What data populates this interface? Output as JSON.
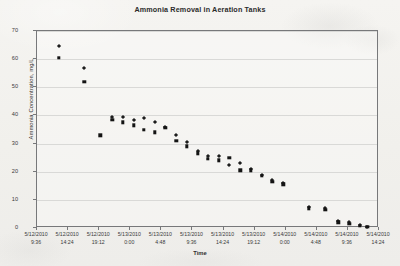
{
  "chart_data": {
    "type": "scatter",
    "title": "Ammonia Removal in Aeration Tanks",
    "xlabel": "Time",
    "ylabel": "Ammonia Concentration, mg/L",
    "grid": true,
    "legend": "none",
    "ylim": [
      0,
      70
    ],
    "yticks": [
      0,
      10,
      20,
      30,
      40,
      50,
      60,
      70
    ],
    "xtick_labels": [
      {
        "date": "5/12/2010",
        "time": "9:36"
      },
      {
        "date": "5/12/2010",
        "time": "14:24"
      },
      {
        "date": "5/12/2010",
        "time": "19:12"
      },
      {
        "date": "5/13/2010",
        "time": "0:00"
      },
      {
        "date": "5/13/2010",
        "time": "4:48"
      },
      {
        "date": "5/13/2010",
        "time": "9:36"
      },
      {
        "date": "5/13/2010",
        "time": "14:24"
      },
      {
        "date": "5/13/2010",
        "time": "19:12"
      },
      {
        "date": "5/14/2010",
        "time": "0:00"
      },
      {
        "date": "5/14/2010",
        "time": "4:48"
      },
      {
        "date": "5/14/2010",
        "time": "9:36"
      },
      {
        "date": "5/14/2010",
        "time": "14:24"
      }
    ],
    "xlim_hours": [
      0,
      52.8
    ],
    "series": [
      {
        "name": "Aeration Tank 1",
        "marker": "diamond",
        "points": [
          {
            "x": 3.4,
            "y": 64.5
          },
          {
            "x": 7.3,
            "y": 57.0
          },
          {
            "x": 11.6,
            "y": 39.5
          },
          {
            "x": 13.2,
            "y": 39.5
          },
          {
            "x": 14.9,
            "y": 38.5
          },
          {
            "x": 16.5,
            "y": 39.0
          },
          {
            "x": 18.2,
            "y": 37.5
          },
          {
            "x": 19.8,
            "y": 36.0
          },
          {
            "x": 21.5,
            "y": 33.0
          },
          {
            "x": 23.1,
            "y": 30.5
          },
          {
            "x": 24.8,
            "y": 27.5
          },
          {
            "x": 26.4,
            "y": 25.5
          },
          {
            "x": 28.1,
            "y": 25.5
          },
          {
            "x": 29.7,
            "y": 22.5
          },
          {
            "x": 31.4,
            "y": 23.0
          },
          {
            "x": 33.0,
            "y": 21.0
          },
          {
            "x": 34.7,
            "y": 19.0
          },
          {
            "x": 36.3,
            "y": 17.0
          },
          {
            "x": 38.0,
            "y": 16.0
          },
          {
            "x": 42.0,
            "y": 7.5
          },
          {
            "x": 44.5,
            "y": 7.0
          },
          {
            "x": 46.5,
            "y": 2.5
          },
          {
            "x": 48.2,
            "y": 2.0
          },
          {
            "x": 49.8,
            "y": 1.0
          },
          {
            "x": 51.0,
            "y": 0.5
          }
        ]
      },
      {
        "name": "Aeration Tank 2",
        "marker": "square",
        "points": [
          {
            "x": 3.4,
            "y": 60.5
          },
          {
            "x": 7.3,
            "y": 52.0
          },
          {
            "x": 9.8,
            "y": 33.0
          },
          {
            "x": 11.6,
            "y": 38.5
          },
          {
            "x": 13.2,
            "y": 37.5
          },
          {
            "x": 14.9,
            "y": 36.5
          },
          {
            "x": 16.5,
            "y": 35.0
          },
          {
            "x": 18.2,
            "y": 34.0
          },
          {
            "x": 19.8,
            "y": 35.5
          },
          {
            "x": 21.5,
            "y": 31.0
          },
          {
            "x": 23.1,
            "y": 29.0
          },
          {
            "x": 24.8,
            "y": 26.5
          },
          {
            "x": 26.4,
            "y": 24.5
          },
          {
            "x": 28.1,
            "y": 24.0
          },
          {
            "x": 29.7,
            "y": 25.0
          },
          {
            "x": 31.4,
            "y": 20.5
          },
          {
            "x": 33.0,
            "y": 20.5
          },
          {
            "x": 34.7,
            "y": 18.5
          },
          {
            "x": 36.3,
            "y": 16.5
          },
          {
            "x": 38.0,
            "y": 15.5
          },
          {
            "x": 42.0,
            "y": 7.0
          },
          {
            "x": 44.5,
            "y": 6.5
          },
          {
            "x": 46.5,
            "y": 2.0
          },
          {
            "x": 48.2,
            "y": 1.5
          },
          {
            "x": 49.8,
            "y": 0.8
          },
          {
            "x": 51.0,
            "y": 0.5
          }
        ]
      }
    ]
  }
}
